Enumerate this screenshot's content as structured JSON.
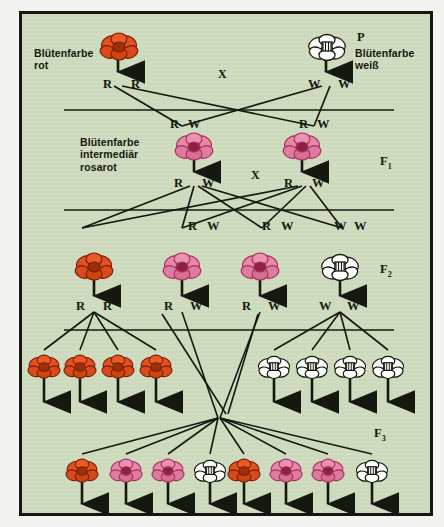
{
  "diagram": {
    "title_hidden": "",
    "background_color": "#cfdcc0",
    "frame_color": "#13170f",
    "colors": {
      "red": "#e2511f",
      "pink": "#e787aa",
      "white": "#fdfdfb",
      "ink": "#15180f"
    },
    "cross_symbol": "X"
  },
  "generation_labels": {
    "p": "P",
    "f1": "F",
    "f1_sub": "1",
    "f2": "F",
    "f2_sub": "2",
    "f3": "F",
    "f3_sub": "3"
  },
  "captions": {
    "parent_red": "Blütenfarbe\nrot",
    "parent_white": "Blütenfarbe\nweiß",
    "f1_pink": "Blütenfarbe\nintermediär\nrosarot"
  },
  "alleles": {
    "r": "R",
    "w": "W"
  },
  "rows": {
    "p_generation": {
      "label": "P",
      "individuals": [
        {
          "color": "red",
          "genotype": [
            "R",
            "R"
          ],
          "x": 107
        },
        {
          "color": "white",
          "genotype": [
            "W",
            "W"
          ],
          "x": 322
        }
      ],
      "cross": "X"
    },
    "p_gametes": [
      {
        "genotype": [
          "R",
          "W"
        ],
        "x": 170
      },
      {
        "genotype": [
          "R",
          "W"
        ],
        "x": 295
      }
    ],
    "f1_generation": {
      "label": "F",
      "sub": "1",
      "individuals": [
        {
          "color": "pink",
          "genotype": [
            "R",
            "W"
          ],
          "x": 178
        },
        {
          "color": "pink",
          "genotype": [
            "R",
            "W"
          ],
          "x": 290
        }
      ],
      "cross": "X"
    },
    "f1_gametes": [
      {
        "genotype": [
          "R",
          "W"
        ],
        "x": 188
      },
      {
        "genotype": [
          "R",
          "W"
        ],
        "x": 262
      },
      {
        "genotype": [
          "W",
          "W"
        ],
        "x": 334
      }
    ],
    "f2_generation": {
      "label": "F",
      "sub": "2",
      "individuals": [
        {
          "color": "red",
          "genotype": [
            "R",
            "R"
          ],
          "x": 88
        },
        {
          "color": "pink",
          "genotype": [
            "R",
            "W"
          ],
          "x": 175
        },
        {
          "color": "pink",
          "genotype": [
            "R",
            "W"
          ],
          "x": 255
        },
        {
          "color": "white",
          "genotype": [
            "W",
            "W"
          ],
          "x": 335
        }
      ]
    },
    "f3_generation": {
      "label": "F",
      "sub": "3",
      "upper_left_group": [
        {
          "color": "red"
        },
        {
          "color": "red"
        },
        {
          "color": "red"
        },
        {
          "color": "red"
        }
      ],
      "upper_right_group": [
        {
          "color": "white"
        },
        {
          "color": "white"
        },
        {
          "color": "white"
        },
        {
          "color": "white"
        }
      ],
      "lower_left_group": [
        {
          "color": "red"
        },
        {
          "color": "pink"
        },
        {
          "color": "pink"
        },
        {
          "color": "white"
        }
      ],
      "lower_right_group": [
        {
          "color": "red"
        },
        {
          "color": "pink"
        },
        {
          "color": "pink"
        },
        {
          "color": "white"
        }
      ]
    }
  }
}
